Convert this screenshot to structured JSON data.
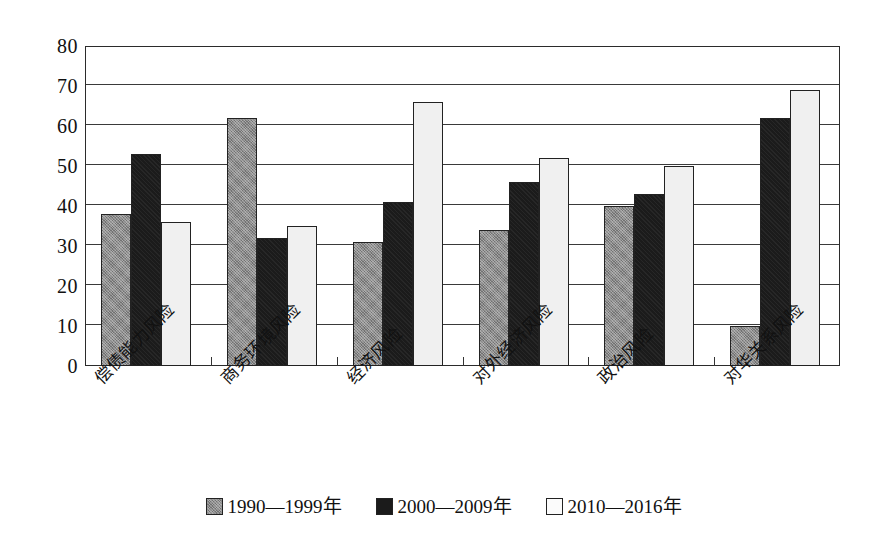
{
  "chart_data": {
    "type": "bar",
    "title": "",
    "subtitle": "",
    "xlabel": "",
    "ylabel": "",
    "ylim": [
      0,
      80
    ],
    "ytick_step": 10,
    "yticks": [
      "80",
      "70",
      "60",
      "50",
      "40",
      "30",
      "20",
      "10",
      "0"
    ],
    "grid": true,
    "legend_position": "bottom-center",
    "categories": [
      "偿债能力风险",
      "商务环境风险",
      "经济风险",
      "对外经济风险",
      "政治风险",
      "对华关系风险"
    ],
    "series": [
      {
        "name": "1990—1999年",
        "color": "#8b8b8b",
        "values": [
          38,
          62,
          31,
          34,
          40,
          10
        ]
      },
      {
        "name": "2000—2009年",
        "color": "#1b1b1b",
        "values": [
          53,
          32,
          41,
          46,
          43,
          62
        ]
      },
      {
        "name": "2010—2016年",
        "color": "#f0f0f0",
        "values": [
          36,
          35,
          66,
          52,
          50,
          69
        ]
      }
    ]
  },
  "legend": {
    "items": [
      {
        "label": "1990—1999年",
        "swatch": "gray-square-icon"
      },
      {
        "label": "2000—2009年",
        "swatch": "black-square-icon"
      },
      {
        "label": "2010—2016年",
        "swatch": "white-square-icon"
      }
    ]
  },
  "axis": {
    "y_max": 80,
    "y_min": 0
  }
}
